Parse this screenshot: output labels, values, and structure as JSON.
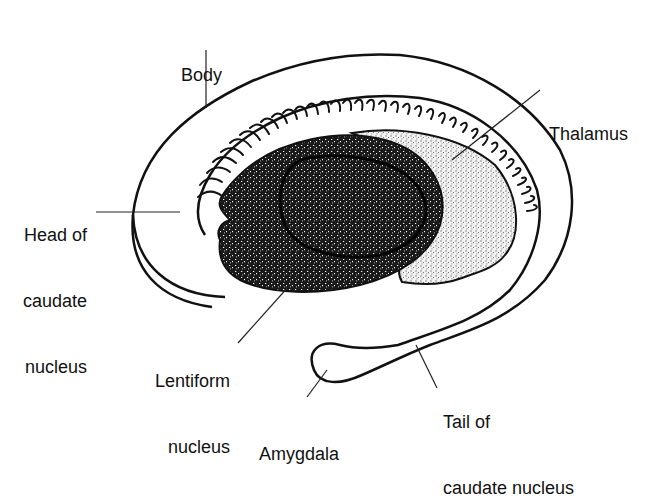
{
  "diagram": {
    "colors": {
      "outline": "#111111",
      "lentiform_fill": "#1a1a1a",
      "thalamus_fill": "#c8c8c8",
      "background": "#ffffff"
    },
    "labels": {
      "body": {
        "lines": [
          "Body"
        ]
      },
      "thalamus": {
        "lines": [
          "Thalamus"
        ]
      },
      "head_of_caudate": {
        "lines": [
          "Head of",
          "caudate",
          "nucleus"
        ]
      },
      "lentiform": {
        "lines": [
          "Lentiform",
          "nucleus"
        ]
      },
      "amygdala": {
        "lines": [
          "Amygdala"
        ]
      },
      "tail_of_caudate": {
        "lines": [
          "Tail of",
          "caudate nucleus"
        ]
      }
    }
  }
}
